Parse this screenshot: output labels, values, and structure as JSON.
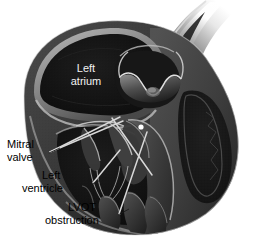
{
  "figure": {
    "background_color": "#ffffff",
    "width": 254,
    "height": 242
  },
  "labels": {
    "left_atrium": "Left\natrium",
    "left_atrium_line1": "Left",
    "left_atrium_line2": "atrium",
    "mitral_valve_line1": "Mitral",
    "mitral_valve_line2": "valve",
    "left_ventricle_line1": "Left",
    "left_ventricle_line2": "ventricle",
    "lvot_line1": "LVOT",
    "lvot_line2": "obstruction"
  },
  "colors": {
    "background": "#ffffff",
    "myocardium_dark": "#2e2e2e",
    "myocardium_mid": "#3d3d3d",
    "myocardium_light": "#5a5a5a",
    "chamber_black": "#141414",
    "highlight": "#cfcfcf",
    "label_text": "#000000",
    "inner_label_text": "#f2f2f2",
    "leader_line": "#1a1a1a",
    "marker_dot": "#ffffff"
  },
  "structures": [
    {
      "name": "left-atrium",
      "label": "Left atrium",
      "labeled": true
    },
    {
      "name": "mitral-valve",
      "label": "Mitral valve",
      "labeled": true
    },
    {
      "name": "left-ventricle",
      "label": "Left ventricle",
      "labeled": true
    },
    {
      "name": "lvot-obstruction",
      "label": "LVOT obstruction",
      "labeled": true
    },
    {
      "name": "aorta",
      "label": "Aorta",
      "labeled": false
    },
    {
      "name": "aortic-valve",
      "label": "Aortic valve",
      "labeled": false
    },
    {
      "name": "right-ventricle",
      "label": "Right ventricle",
      "labeled": false
    },
    {
      "name": "interventricular-septum",
      "label": "Interventricular septum",
      "labeled": false
    },
    {
      "name": "papillary-muscle",
      "label": "Papillary muscle",
      "labeled": false
    }
  ]
}
